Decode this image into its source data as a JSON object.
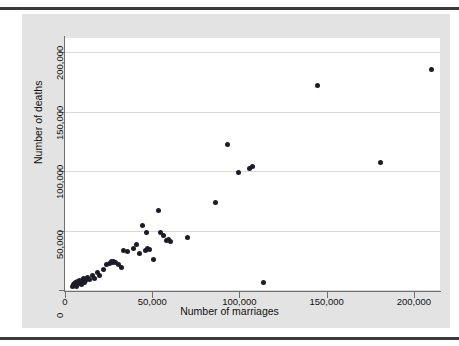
{
  "figure": {
    "background_color": "#e3e3e3",
    "plot_background_color": "#ffffff",
    "marker_color": "#1c1c28",
    "gridline_color": "#d8d8d8",
    "axis_color": "#6f6f6f",
    "rule_color": "#3a3a3a"
  },
  "chart_data": {
    "type": "scatter",
    "title": "",
    "xlabel": "Number of marriages",
    "ylabel": "Number of deaths",
    "xlim": [
      0,
      215000
    ],
    "ylim": [
      0,
      212000
    ],
    "xticks": [
      0,
      50000,
      100000,
      150000,
      200000
    ],
    "yticks": [
      0,
      50000,
      100000,
      150000,
      200000
    ],
    "xticklabels": [
      "0",
      "50,000",
      "100,000",
      "150,000",
      "200,000"
    ],
    "yticklabels": [
      "0",
      "50,000",
      "100,000",
      "150,000",
      "200,000"
    ],
    "grid": "horizontal",
    "legend": "none",
    "marker": "filled-circle",
    "points": [
      [
        4200,
        3200
      ],
      [
        5000,
        4300
      ],
      [
        5400,
        5600
      ],
      [
        5900,
        4000
      ],
      [
        6200,
        6300
      ],
      [
        6600,
        3000
      ],
      [
        7000,
        7400
      ],
      [
        7500,
        5100
      ],
      [
        8100,
        8300
      ],
      [
        8600,
        6000
      ],
      [
        9200,
        4600
      ],
      [
        9900,
        7200
      ],
      [
        10500,
        9300
      ],
      [
        11200,
        6500
      ],
      [
        12000,
        8000
      ],
      [
        13000,
        10500
      ],
      [
        14200,
        9000
      ],
      [
        15500,
        12000
      ],
      [
        17000,
        10000
      ],
      [
        18500,
        14500
      ],
      [
        20000,
        12500
      ],
      [
        22000,
        17500
      ],
      [
        24000,
        21500
      ],
      [
        25500,
        22500
      ],
      [
        26500,
        23800
      ],
      [
        27200,
        22800
      ],
      [
        28000,
        24200
      ],
      [
        28800,
        23500
      ],
      [
        30500,
        21500
      ],
      [
        32500,
        19000
      ],
      [
        33500,
        33500
      ],
      [
        36000,
        32500
      ],
      [
        39000,
        35000
      ],
      [
        41000,
        38000
      ],
      [
        42500,
        31000
      ],
      [
        44500,
        54000
      ],
      [
        46000,
        33500
      ],
      [
        46800,
        48000
      ],
      [
        47500,
        34500
      ],
      [
        48500,
        34000
      ],
      [
        50500,
        25500
      ],
      [
        53500,
        67000
      ],
      [
        54500,
        48500
      ],
      [
        56500,
        45500
      ],
      [
        58000,
        41500
      ],
      [
        59500,
        42500
      ],
      [
        60500,
        40500
      ],
      [
        70500,
        44500
      ],
      [
        86500,
        74000
      ],
      [
        93000,
        122500
      ],
      [
        99500,
        98500
      ],
      [
        105500,
        102000
      ],
      [
        107500,
        103500
      ],
      [
        114000,
        6000
      ],
      [
        144500,
        172000
      ],
      [
        181000,
        107500
      ],
      [
        210000,
        185500
      ]
    ]
  }
}
